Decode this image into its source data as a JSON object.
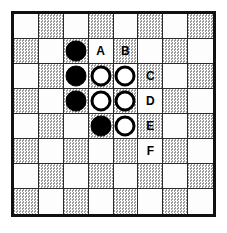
{
  "board": {
    "title": "Othello board diagram",
    "columns": 8,
    "rows": 8,
    "light_color": "#fdfdfd",
    "dark_color": "#d2d2d2",
    "border_color": "#111111",
    "grid_line_color": "#2a2a2a",
    "square_colors": [
      [
        "light",
        "dark",
        "light",
        "dark",
        "light",
        "dark",
        "light",
        "dark"
      ],
      [
        "dark",
        "light",
        "dark",
        "light",
        "dark",
        "light",
        "dark",
        "light"
      ],
      [
        "light",
        "dark",
        "light",
        "dark",
        "light",
        "dark",
        "light",
        "dark"
      ],
      [
        "dark",
        "light",
        "dark",
        "light",
        "dark",
        "light",
        "dark",
        "light"
      ],
      [
        "light",
        "dark",
        "light",
        "dark",
        "light",
        "dark",
        "light",
        "dark"
      ],
      [
        "dark",
        "light",
        "dark",
        "light",
        "dark",
        "light",
        "dark",
        "light"
      ],
      [
        "light",
        "dark",
        "light",
        "dark",
        "light",
        "dark",
        "light",
        "dark"
      ],
      [
        "dark",
        "light",
        "dark",
        "light",
        "dark",
        "light",
        "dark",
        "light"
      ]
    ],
    "pieces": [
      {
        "row": 2,
        "col": 3,
        "color": "black"
      },
      {
        "row": 3,
        "col": 3,
        "color": "black"
      },
      {
        "row": 3,
        "col": 4,
        "color": "white"
      },
      {
        "row": 3,
        "col": 5,
        "color": "white"
      },
      {
        "row": 4,
        "col": 3,
        "color": "black"
      },
      {
        "row": 4,
        "col": 4,
        "color": "white"
      },
      {
        "row": 4,
        "col": 5,
        "color": "white"
      },
      {
        "row": 5,
        "col": 4,
        "color": "black"
      },
      {
        "row": 5,
        "col": 5,
        "color": "white"
      }
    ],
    "labels": [
      {
        "row": 2,
        "col": 4,
        "text": "A"
      },
      {
        "row": 2,
        "col": 5,
        "text": "B"
      },
      {
        "row": 3,
        "col": 6,
        "text": "C"
      },
      {
        "row": 4,
        "col": 6,
        "text": "D"
      },
      {
        "row": 5,
        "col": 6,
        "text": "E"
      },
      {
        "row": 6,
        "col": 6,
        "text": "F"
      }
    ],
    "piece_counts": {
      "black": 4,
      "white": 5,
      "total": 9
    },
    "move_options": [
      "A",
      "B",
      "C",
      "D",
      "E",
      "F"
    ]
  }
}
